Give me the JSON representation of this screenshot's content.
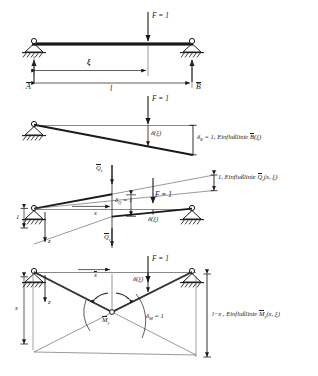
{
  "figure": {
    "line_color": "#1a1a1a",
    "thin_color": "#555555",
    "background": "#ffffff"
  },
  "panel1": {
    "name": "beam-with-unit-load",
    "load_label": "F = 1",
    "reaction_left": "A",
    "reaction_right": "B",
    "dim_xi": "ξ",
    "dim_span": "l"
  },
  "panel2": {
    "name": "influence-line-B",
    "load_label": "F = 1",
    "delta_label": "δ(ξ)",
    "result_label": "δ",
    "result_sub": "B",
    "result_rest": " = 1, Einflußlinie ",
    "result_sym": "B",
    "result_arg": "(ξ)"
  },
  "panel3": {
    "name": "influence-line-Qz",
    "load_label": "F = 1",
    "delta_label": "δ(ξ)",
    "shear_top": "Q",
    "shear_top_sub": "z",
    "shear_bottom": "Q",
    "shear_bottom_sub": "z",
    "delta_q": "δ",
    "delta_q_sub": "Q",
    "delta_q_rest": " = 1",
    "dim_x": "x",
    "dim_one": "1",
    "axis_z": "z",
    "result_prefix": "1, Einflußlinie ",
    "result_sym": "Q",
    "result_sub": "z",
    "result_arg": "(x, ξ)"
  },
  "panel4": {
    "name": "influence-line-My",
    "load_label": "F = 1",
    "delta_label": "δ(ξ)",
    "moment_sym": "M",
    "moment_sub": "y",
    "delta_m": "δ",
    "delta_m_sub": "M",
    "delta_m_rest": " = 1",
    "dim_x": "x",
    "axis_z": "z",
    "result_prefix": "l−x , Einflußlinie ",
    "result_sym": "M",
    "result_sub": "y",
    "result_arg": "(x, ξ)"
  }
}
